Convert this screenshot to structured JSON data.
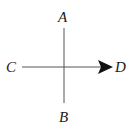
{
  "diagram": {
    "labels": {
      "top": "A",
      "bottom": "B",
      "left": "C",
      "right": "D"
    },
    "colors": {
      "line": "#555555",
      "arrow": "#111111",
      "text": "#1a1a1a",
      "background": "#ffffff"
    }
  }
}
